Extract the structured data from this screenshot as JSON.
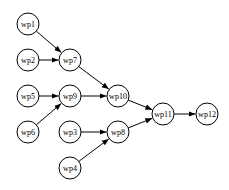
{
  "diagram": {
    "type": "directed-graph",
    "node_radius": 11,
    "colors": {
      "stroke": "#000000",
      "fill": "#ffffff",
      "text": "#000000"
    },
    "nodes": [
      {
        "id": "wp1",
        "label": "wp1",
        "x": 28,
        "y": 24
      },
      {
        "id": "wp2",
        "label": "wp2",
        "x": 28,
        "y": 60
      },
      {
        "id": "wp7",
        "label": "wp7",
        "x": 70,
        "y": 60
      },
      {
        "id": "wp5",
        "label": "wp5",
        "x": 28,
        "y": 96
      },
      {
        "id": "wp9",
        "label": "wp9",
        "x": 70,
        "y": 96
      },
      {
        "id": "wp10",
        "label": "wp10",
        "x": 118,
        "y": 96
      },
      {
        "id": "wp6",
        "label": "wp6",
        "x": 28,
        "y": 132
      },
      {
        "id": "wp3",
        "label": "wp3",
        "x": 70,
        "y": 132
      },
      {
        "id": "wp8",
        "label": "wp8",
        "x": 118,
        "y": 132
      },
      {
        "id": "wp4",
        "label": "wp4",
        "x": 70,
        "y": 168
      },
      {
        "id": "wp11",
        "label": "wp11",
        "x": 163,
        "y": 114
      },
      {
        "id": "wp12",
        "label": "wp12",
        "x": 207,
        "y": 114
      }
    ],
    "edges": [
      {
        "from": "wp1",
        "to": "wp7"
      },
      {
        "from": "wp2",
        "to": "wp7"
      },
      {
        "from": "wp7",
        "to": "wp10"
      },
      {
        "from": "wp5",
        "to": "wp9"
      },
      {
        "from": "wp6",
        "to": "wp9"
      },
      {
        "from": "wp9",
        "to": "wp10"
      },
      {
        "from": "wp3",
        "to": "wp8"
      },
      {
        "from": "wp4",
        "to": "wp8"
      },
      {
        "from": "wp10",
        "to": "wp11"
      },
      {
        "from": "wp8",
        "to": "wp11"
      },
      {
        "from": "wp11",
        "to": "wp12"
      }
    ]
  }
}
